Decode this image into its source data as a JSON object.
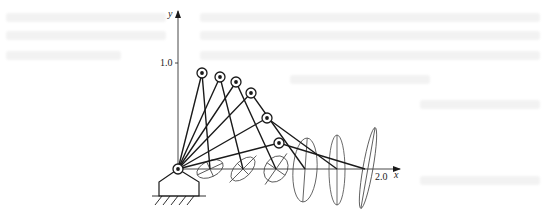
{
  "figure": {
    "axes": {
      "x_label": "x",
      "y_label": "y",
      "x_tick_label": "2.0",
      "y_tick_label": "1.0"
    },
    "base": {
      "type": "ground-pivot",
      "position": [
        0,
        0
      ]
    },
    "configurations": [
      {
        "id": 1,
        "elbow": [
          0.23,
          0.91
        ],
        "end_effector": [
          0.3,
          0
        ],
        "ellipse": {
          "rx": 14,
          "ry": 8,
          "angle_deg": -25
        }
      },
      {
        "id": 2,
        "elbow": [
          0.4,
          0.87
        ],
        "end_effector": [
          0.6,
          0
        ],
        "ellipse": {
          "rx": 15,
          "ry": 8,
          "angle_deg": -45
        }
      },
      {
        "id": 3,
        "elbow": [
          0.55,
          0.82
        ],
        "end_effector": [
          0.9,
          0
        ],
        "ellipse": {
          "rx": 14,
          "ry": 11,
          "angle_deg": -55
        }
      },
      {
        "id": 4,
        "elbow": [
          0.69,
          0.72
        ],
        "end_effector": [
          1.2,
          0
        ],
        "ellipse": {
          "rx": 12,
          "ry": 32,
          "angle_deg": 4
        }
      },
      {
        "id": 5,
        "elbow": [
          0.84,
          0.48
        ],
        "end_effector": [
          1.5,
          0
        ],
        "ellipse": {
          "rx": 8,
          "ry": 35,
          "angle_deg": 0
        }
      },
      {
        "id": 6,
        "elbow": [
          0.95,
          0.25
        ],
        "end_effector": [
          1.77,
          0
        ],
        "ellipse": {
          "rx": 4,
          "ry": 40,
          "angle_deg": 10
        }
      }
    ],
    "colors": {
      "line": "#1a1a1a",
      "thin_line": "#444444",
      "bleed_text": "#e6e6e6"
    }
  }
}
